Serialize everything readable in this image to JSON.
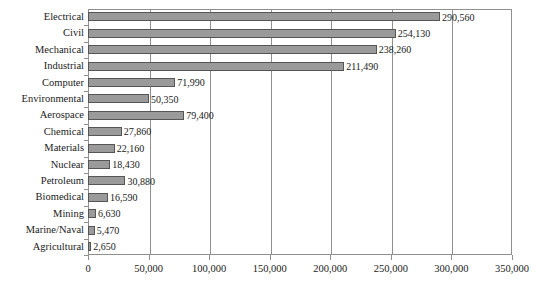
{
  "chart_data": {
    "type": "bar",
    "orientation": "horizontal",
    "title": "",
    "subtitle": "",
    "xlabel": "",
    "ylabel": "",
    "xlim": [
      0,
      350000
    ],
    "ylim": null,
    "grid": true,
    "legend": null,
    "legend_position": "none",
    "xticks": [
      0,
      50000,
      100000,
      150000,
      200000,
      250000,
      300000,
      350000
    ],
    "xtick_labels": [
      "0",
      "50,000",
      "100,000",
      "150,000",
      "200,000",
      "250,000",
      "300,000",
      "350,000"
    ],
    "categories": [
      "Electrical",
      "Civil",
      "Mechanical",
      "Industrial",
      "Computer",
      "Environmental",
      "Aerospace",
      "Chemical",
      "Materials",
      "Nuclear",
      "Petroleum",
      "Biomedical",
      "Mining",
      "Marine/Naval",
      "Agricultural"
    ],
    "values": [
      290560,
      254130,
      238260,
      211490,
      71990,
      50350,
      79400,
      27860,
      22160,
      18430,
      30880,
      16590,
      6630,
      5470,
      2650
    ],
    "data_labels": [
      "290,560",
      "254,130",
      "238,260",
      "211,490",
      "71,990",
      "50,350",
      "79,400",
      "27,860",
      "22,160",
      "18,430",
      "30,880",
      "16,590",
      "6,630",
      "5,470",
      "2,650"
    ],
    "colors": {
      "bar_fill": "#9a9a9a",
      "bar_edge": "#565656",
      "gridline": "#8f8f8f",
      "axis": "#8f8f8f",
      "text": "#1a1a1a",
      "background": "#ffffff"
    }
  }
}
